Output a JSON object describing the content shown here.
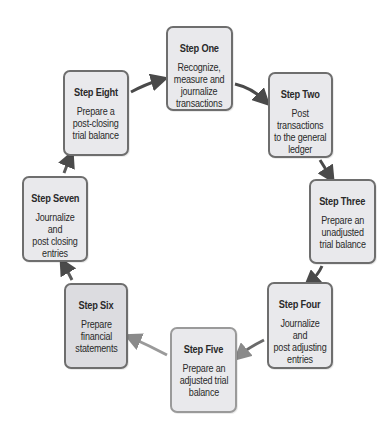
{
  "diagram": {
    "type": "accounting-cycle",
    "colors": {
      "box_fill": "#e9e9ec",
      "box_fill_dark": "#dcdce0",
      "box_border": "#6e6e6e",
      "arrow_dark": "#4a4a4a",
      "arrow_light": "#8a8a8a"
    },
    "steps": [
      {
        "title": "Step One",
        "lines": [
          "Recognize,",
          "measure and",
          "journalize",
          "transactions"
        ]
      },
      {
        "title": "Step Two",
        "lines": [
          "Post",
          "transactions",
          "to the general",
          "ledger"
        ]
      },
      {
        "title": "Step Three",
        "lines": [
          "Prepare an",
          "unadjusted",
          "trial balance"
        ]
      },
      {
        "title": "Step Four",
        "lines": [
          "Journalize and",
          "post adjusting",
          "entries"
        ]
      },
      {
        "title": "Step Five",
        "lines": [
          "Prepare an",
          "adjusted trial",
          "balance"
        ]
      },
      {
        "title": "Step Six",
        "lines": [
          "Prepare",
          "financial",
          "statements"
        ]
      },
      {
        "title": "Step Seven",
        "lines": [
          "Journalize and",
          "post closing",
          "entries"
        ]
      },
      {
        "title": "Step Eight",
        "lines": [
          "Prepare a",
          "post-closing",
          "trial balance"
        ]
      }
    ],
    "arrows": [
      {
        "from": "Step One",
        "to": "Step Two"
      },
      {
        "from": "Step Two",
        "to": "Step Three"
      },
      {
        "from": "Step Three",
        "to": "Step Four"
      },
      {
        "from": "Step Four",
        "to": "Step Five"
      },
      {
        "from": "Step Five",
        "to": "Step Six"
      },
      {
        "from": "Step Six",
        "to": "Step Seven"
      },
      {
        "from": "Step Seven",
        "to": "Step Eight"
      },
      {
        "from": "Step Eight",
        "to": "Step One"
      }
    ]
  }
}
